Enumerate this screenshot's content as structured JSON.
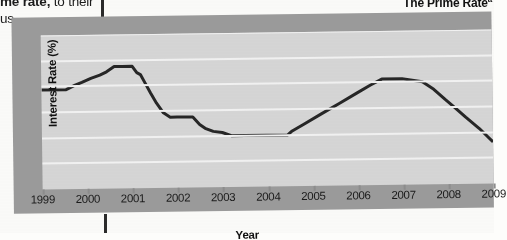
{
  "page": {
    "body_text_line1_bold": "me rate,",
    "body_text_line1_rest": " to their",
    "body_text_line2": "us-"
  },
  "figure": {
    "title": "The Prime Rate",
    "title_superscript": "a",
    "x_axis_title": "Year",
    "y_axis_title": "Interest Rate (%)"
  },
  "chart_data": {
    "type": "line",
    "title": "The Prime Rate",
    "xlabel": "Year",
    "ylabel": "Interest Rate (%)",
    "xlim": [
      1999,
      2009
    ],
    "ylim": [
      0,
      12
    ],
    "ytick_labels": [
      "0",
      "2.0",
      "4.0",
      "6.0",
      "8.0",
      "10.0",
      "12.0"
    ],
    "ytick_values": [
      0,
      2,
      4,
      6,
      8,
      10,
      12
    ],
    "xtick_labels": [
      "1999",
      "2000",
      "2001",
      "2002",
      "2003",
      "2004",
      "2005",
      "2006",
      "2007",
      "2008",
      "2009"
    ],
    "xtick_values": [
      1999,
      2000,
      2001,
      2002,
      2003,
      2004,
      2005,
      2006,
      2007,
      2008,
      2009
    ],
    "grid": "horizontal",
    "legend": "none",
    "series": [
      {
        "name": "Prime Rate",
        "color": "#262626",
        "x": [
          1999.0,
          1999.55,
          1999.75,
          1999.9,
          2000.1,
          2000.3,
          2000.45,
          2000.62,
          2000.8,
          2001.02,
          2001.12,
          2001.2,
          2001.3,
          2001.42,
          2001.55,
          2001.7,
          2001.85,
          2002.0,
          2002.35,
          2002.5,
          2002.62,
          2002.8,
          2003.0,
          2003.2,
          2003.5,
          2004.0,
          2004.45,
          2004.55,
          2004.8,
          2005.2,
          2005.6,
          2006.0,
          2006.3,
          2006.55,
          2007.0,
          2007.45,
          2007.7,
          2007.95,
          2008.15,
          2008.4,
          2008.7,
          2009.0
        ],
        "y": [
          7.75,
          7.75,
          8.1,
          8.3,
          8.6,
          8.85,
          9.1,
          9.5,
          9.5,
          9.5,
          9.0,
          8.85,
          8.2,
          7.4,
          6.6,
          5.85,
          5.5,
          5.5,
          5.5,
          4.9,
          4.6,
          4.35,
          4.25,
          4.0,
          4.0,
          4.0,
          4.0,
          4.3,
          4.8,
          5.6,
          6.4,
          7.2,
          7.8,
          8.25,
          8.25,
          8.0,
          7.4,
          6.6,
          6.0,
          5.2,
          4.3,
          3.25
        ],
        "description": "U.S. prime interest rate, 1999-2009: ~7.75% in 1999, peak ~9.5% late 2000, sharp decline to ~4.0% 2003-2004, rise to ~8.25% 2006-2007, then fall to ~3.25% by 2009"
      }
    ]
  }
}
